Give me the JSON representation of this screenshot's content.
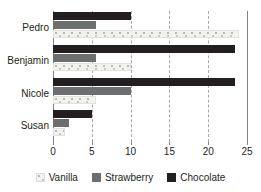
{
  "chart_data": {
    "type": "bar",
    "orientation": "horizontal",
    "title": "",
    "xlabel": "",
    "ylabel": "",
    "categories": [
      "Pedro",
      "Benjamin",
      "Nicole",
      "Susan"
    ],
    "series": [
      {
        "name": "Vanilla",
        "color": "#f2f2ef",
        "values": [
          24,
          10,
          5.5,
          1.5
        ]
      },
      {
        "name": "Strawberry",
        "color": "#6d6e70",
        "values": [
          5.5,
          5.5,
          10,
          2
        ]
      },
      {
        "name": "Chocolate",
        "color": "#231f20",
        "values": [
          10,
          23.5,
          23.5,
          5
        ]
      }
    ],
    "xlim": [
      0,
      25
    ],
    "xticks": [
      0,
      5,
      10,
      15,
      20,
      25
    ],
    "xtick_labels": [
      "0",
      "5",
      "10",
      "15",
      "20",
      "25"
    ],
    "grid": true,
    "grid_style": "dashed-vertical",
    "legend_position": "bottom"
  },
  "axis": {
    "tick_labels": [
      "0",
      "5",
      "10",
      "15",
      "20",
      "25"
    ]
  },
  "categories": {
    "labels": [
      "Pedro",
      "Benjamin",
      "Nicole",
      "Susan"
    ]
  },
  "legend": {
    "items": [
      {
        "label": "Vanilla",
        "swatch": "vanilla-swatch"
      },
      {
        "label": "Strawberry",
        "swatch": "strawberry-swatch"
      },
      {
        "label": "Chocolate",
        "swatch": "chocolate-swatch"
      }
    ]
  }
}
